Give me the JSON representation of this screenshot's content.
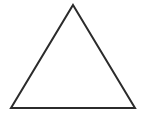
{
  "canvas": {
    "width": 145,
    "height": 117,
    "background_color": "#ffffff"
  },
  "figure": {
    "name": "triangle",
    "type": "polygon",
    "fill": "none",
    "stroke_color": "#2b2b2b",
    "stroke_width": 2,
    "vertices": [
      {
        "label": "apex",
        "x": 73,
        "y": 5
      },
      {
        "label": "bottom-right",
        "x": 135,
        "y": 108
      },
      {
        "label": "bottom-left",
        "x": 11,
        "y": 108
      }
    ],
    "points_attr": "73,5 135,108 11,108",
    "edges": [
      {
        "name": "left-edge",
        "from": "apex",
        "to": "bottom-left"
      },
      {
        "name": "right-edge",
        "from": "apex",
        "to": "bottom-right"
      },
      {
        "name": "base-edge",
        "from": "bottom-left",
        "to": "bottom-right"
      }
    ]
  },
  "labels": {
    "text_items": []
  }
}
